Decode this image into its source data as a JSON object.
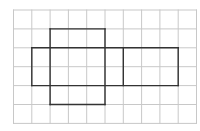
{
  "diagram": {
    "type": "grid-net",
    "grid": {
      "cols": 10,
      "rows": 6,
      "origin_x": 13.5,
      "origin_y": 10,
      "cell_w": 18.3,
      "cell_h": 18.9,
      "line_color": "#c8c8c8",
      "line_width": 1
    },
    "outline": {
      "color": "#333333",
      "width": 1.4,
      "segments": [
        {
          "from": [
            2,
            1
          ],
          "to": [
            5,
            1
          ]
        },
        {
          "from": [
            1,
            2
          ],
          "to": [
            9,
            2
          ]
        },
        {
          "from": [
            1,
            4
          ],
          "to": [
            9,
            4
          ]
        },
        {
          "from": [
            2,
            5
          ],
          "to": [
            5,
            5
          ]
        },
        {
          "from": [
            1,
            2
          ],
          "to": [
            1,
            4
          ]
        },
        {
          "from": [
            2,
            1
          ],
          "to": [
            2,
            5
          ]
        },
        {
          "from": [
            5,
            1
          ],
          "to": [
            5,
            5
          ]
        },
        {
          "from": [
            6,
            2
          ],
          "to": [
            6,
            4
          ]
        },
        {
          "from": [
            9,
            2
          ],
          "to": [
            9,
            4
          ]
        }
      ]
    }
  }
}
